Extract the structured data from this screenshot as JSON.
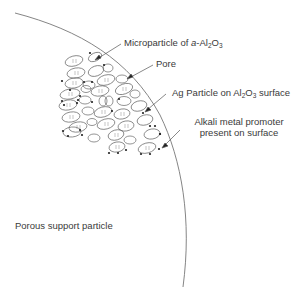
{
  "diagram": {
    "labels": {
      "microparticle": {
        "prefix": "Microparticle of ",
        "italic": "a",
        "mid": "-Al",
        "sub1": "2",
        "o": "O",
        "sub2": "3"
      },
      "pore": "Pore",
      "ag_particle": {
        "prefix": "Ag Particle on Al",
        "sub1": "2",
        "o": "O",
        "sub2": "3",
        "suffix": " surface"
      },
      "alkali_line1": "Alkali metal promoter",
      "alkali_line2": "present on surface",
      "support": "Porous support particle"
    },
    "colors": {
      "line": "#666666",
      "text": "#3a3a3a",
      "dot": "#222222",
      "background": "#ffffff"
    }
  }
}
